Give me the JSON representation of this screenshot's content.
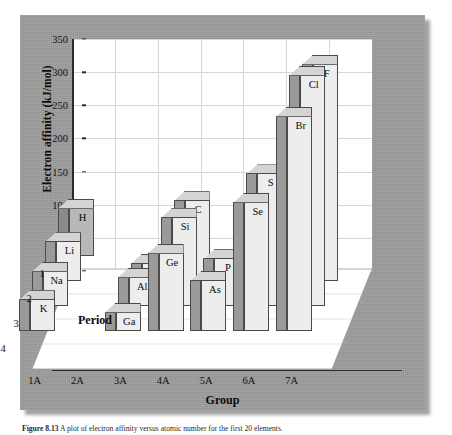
{
  "figure": {
    "caption_label": "Figure 8.13",
    "caption_text": "A plot of electron affinity versus atomic number for the first 20 elements."
  },
  "chart_data": {
    "type": "bar",
    "title": "",
    "subtitle": "",
    "projection": "3d",
    "xlabel": "Group",
    "ylabel": "Electron affinity (kJ/mol)",
    "zlabel": "Period",
    "ylim": [
      0,
      350
    ],
    "ytick_step": 50,
    "grid": true,
    "legend": "none",
    "categories": [
      "1A",
      "2A",
      "3A",
      "4A",
      "5A",
      "6A",
      "7A"
    ],
    "depth_categories": [
      "1",
      "2",
      "3",
      "4"
    ],
    "yticks": [
      "350",
      "300",
      "250",
      "200",
      "150",
      "100",
      "50",
      "0"
    ],
    "series": [
      {
        "name": "1",
        "period": 1,
        "points": [
          {
            "group": "1A",
            "symbol": "H",
            "value": 73
          }
        ]
      },
      {
        "name": "2",
        "period": 2,
        "points": [
          {
            "group": "1A",
            "symbol": "Li",
            "value": 60
          },
          {
            "group": "2A",
            "symbol": "Be",
            "value": 0
          },
          {
            "group": "3A",
            "symbol": "B",
            "value": 27
          },
          {
            "group": "4A",
            "symbol": "C",
            "value": 122
          },
          {
            "group": "5A",
            "symbol": "N",
            "value": 0
          },
          {
            "group": "6A",
            "symbol": "O",
            "value": 141
          },
          {
            "group": "7A",
            "symbol": "F",
            "value": 328
          }
        ]
      },
      {
        "name": "3",
        "period": 3,
        "points": [
          {
            "group": "1A",
            "symbol": "Na",
            "value": 53
          },
          {
            "group": "2A",
            "symbol": "Mg",
            "value": 0
          },
          {
            "group": "3A",
            "symbol": "Al",
            "value": 44
          },
          {
            "group": "4A",
            "symbol": "Si",
            "value": 134
          },
          {
            "group": "5A",
            "symbol": "P",
            "value": 72
          },
          {
            "group": "6A",
            "symbol": "S",
            "value": 200
          },
          {
            "group": "7A",
            "symbol": "Cl",
            "value": 349
          }
        ]
      },
      {
        "name": "4",
        "period": 4,
        "points": [
          {
            "group": "1A",
            "symbol": "K",
            "value": 48
          },
          {
            "group": "2A",
            "symbol": "Ca",
            "value": 0
          },
          {
            "group": "3A",
            "symbol": "Ga",
            "value": 29
          },
          {
            "group": "4A",
            "symbol": "Ge",
            "value": 118
          },
          {
            "group": "5A",
            "symbol": "As",
            "value": 77
          },
          {
            "group": "6A",
            "symbol": "Se",
            "value": 195
          },
          {
            "group": "7A",
            "symbol": "Br",
            "value": 325
          }
        ]
      }
    ]
  },
  "colors": {
    "panel": "#9d9d9d",
    "wall": "#ffffff",
    "grid": "#d7d7d7",
    "axis": "#2b2b2b",
    "bar_front_light": "#ededed",
    "bar_front_dark": "#b8b8b8",
    "bar_side_light": "#9a9a9a",
    "bar_side_dark": "#8a8a8a",
    "bar_top": "#d4d4d4",
    "bar_edge": "#4a4a4a"
  }
}
